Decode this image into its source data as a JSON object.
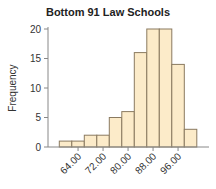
{
  "chart_data": {
    "type": "bar",
    "title": "Bottom 91 Law Schools",
    "xlabel": "",
    "ylabel": "Frequency",
    "bin_edges": [
      58,
      62,
      66,
      70,
      74,
      78,
      82,
      86,
      90,
      94,
      98,
      102
    ],
    "values": [
      1,
      1,
      2,
      2,
      5,
      6,
      16,
      20,
      20,
      14,
      3
    ],
    "xticks": [
      64,
      72,
      80,
      88,
      96
    ],
    "xtick_labels": [
      "64.00",
      "72.00",
      "80.00",
      "88.00",
      "96.00"
    ],
    "yticks": [
      0,
      5,
      10,
      15,
      20
    ],
    "ytick_labels": [
      "0",
      "5",
      "10",
      "15",
      "20"
    ],
    "ylim": [
      0,
      20
    ],
    "grid": false,
    "colors": {
      "fill": "#fcebc9",
      "stroke": "#8a7a60",
      "axis": "#888888"
    }
  }
}
